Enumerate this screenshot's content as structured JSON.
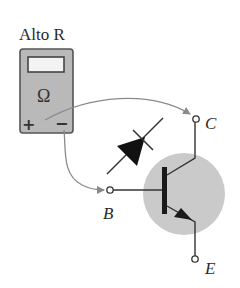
{
  "diagram": {
    "meter": {
      "title": "Alto R",
      "unit_symbol": "Ω",
      "plus_label": "+",
      "minus_label": "−"
    },
    "terminals": {
      "collector": "C",
      "base": "B",
      "emitter": "E"
    },
    "colors": {
      "meter_body": "#b8b8b8",
      "meter_border": "#555555",
      "display": "#f2f2f2",
      "transistor_fill": "#c8c8c8",
      "lead_wire": "#8a8a8a",
      "line": "#333333"
    }
  }
}
